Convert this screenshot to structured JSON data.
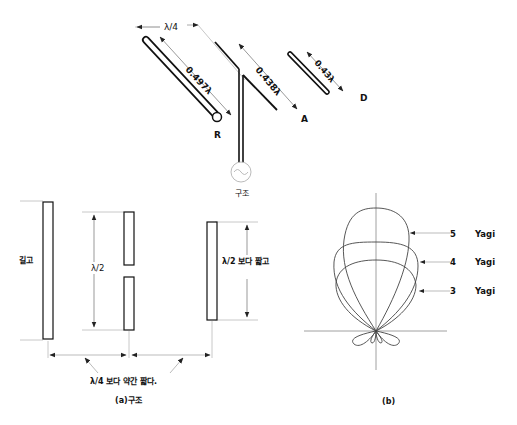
{
  "top_diagram": {
    "spacing_label": "λ/4",
    "reflector": {
      "label": "R",
      "length_label": "0.497λ"
    },
    "driven": {
      "label": "A",
      "length_label": "0.438λ"
    },
    "director": {
      "label": "D",
      "length_label": "0.43λ"
    },
    "source_caption": "구조"
  },
  "structure_diagram": {
    "reflector_note": "길고",
    "driven_length": "λ/2",
    "director_note": "λ/2 보다 짧고",
    "spacing_note": "λ/4 보다 약간 짧다.",
    "caption": "(a)구조"
  },
  "pattern_diagram": {
    "legend": [
      {
        "count": "5",
        "name": "Yagi"
      },
      {
        "count": "4",
        "name": "Yagi"
      },
      {
        "count": "3",
        "name": "Yagi"
      }
    ],
    "caption": "(b)"
  }
}
